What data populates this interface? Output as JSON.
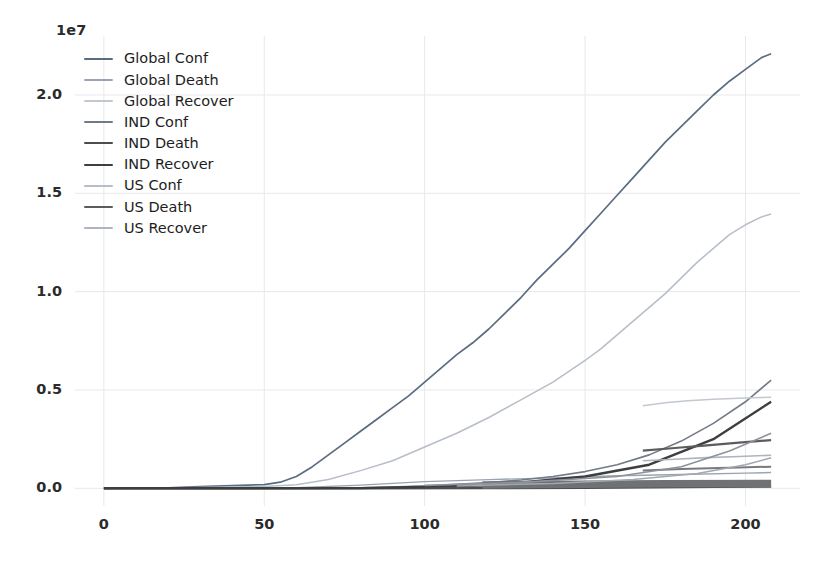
{
  "chart_data": {
    "type": "line",
    "title": "",
    "xlabel": "",
    "ylabel": "",
    "y_exponent_label": "1e7",
    "xlim": [
      -9,
      217
    ],
    "ylim": [
      -900000,
      23000000
    ],
    "xticks": [
      0,
      50,
      100,
      150,
      200
    ],
    "yticks": [
      0.0,
      0.5,
      1.0,
      1.5,
      2.0
    ],
    "ytick_labels": [
      "0.0",
      "0.5",
      "1.0",
      "1.5",
      "2.0"
    ],
    "xtick_labels": [
      "0",
      "50",
      "100",
      "150",
      "200"
    ],
    "grid": true,
    "grid_color": "#e8e8ec",
    "legend_position": "upper left",
    "series": [
      {
        "name": "Global Conf",
        "color": "#5a6b82",
        "width": 1.7,
        "x": [
          0,
          10,
          20,
          30,
          40,
          50,
          55,
          60,
          65,
          70,
          75,
          80,
          85,
          90,
          95,
          100,
          105,
          110,
          115,
          120,
          125,
          130,
          135,
          140,
          145,
          150,
          155,
          160,
          165,
          170,
          175,
          180,
          185,
          190,
          195,
          200,
          205,
          208
        ],
        "y": [
          555,
          4500,
          28000,
          86000,
          140000,
          190000,
          310000,
          600000,
          1100000,
          1700000,
          2300000,
          2900000,
          3500000,
          4100000,
          4700000,
          5400000,
          6100000,
          6800000,
          7400000,
          8100000,
          8900000,
          9700000,
          10600000,
          11400000,
          12200000,
          13100000,
          14000000,
          14900000,
          15800000,
          16700000,
          17600000,
          18400000,
          19200000,
          20000000,
          20700000,
          21300000,
          21900000,
          22100000
        ]
      },
      {
        "name": "Global Death",
        "color": "#9aa4b1",
        "width": 1.4,
        "x": [
          0,
          20,
          40,
          60,
          80,
          100,
          120,
          140,
          160,
          180,
          200,
          208
        ],
        "y": [
          17,
          800,
          5000,
          25000,
          160000,
          340000,
          440000,
          530000,
          640000,
          700000,
          770000,
          800000
        ]
      },
      {
        "name": "Global Recover",
        "color": "#b7bec9",
        "width": 1.5,
        "x": [
          0,
          10,
          20,
          30,
          40,
          50,
          60,
          70,
          80,
          90,
          100,
          110,
          120,
          130,
          140,
          150,
          155,
          160,
          165,
          170,
          175,
          180,
          185,
          190,
          195,
          200,
          205,
          208
        ],
        "y": [
          28,
          1500,
          12000,
          42000,
          70000,
          95000,
          180000,
          450000,
          900000,
          1400000,
          2100000,
          2800000,
          3600000,
          4500000,
          5400000,
          6500000,
          7100000,
          7800000,
          8500000,
          9200000,
          9900000,
          10700000,
          11500000,
          12200000,
          12900000,
          13400000,
          13800000,
          13950000
        ]
      },
      {
        "name": "IND Conf",
        "color": "#707a88",
        "width": 1.6,
        "x": [
          0,
          20,
          40,
          60,
          80,
          100,
          120,
          130,
          140,
          150,
          160,
          170,
          180,
          190,
          200,
          208
        ],
        "y": [
          0,
          3,
          500,
          5000,
          30000,
          110000,
          290000,
          420000,
          600000,
          850000,
          1200000,
          1700000,
          2400000,
          3300000,
          4400000,
          5500000
        ]
      },
      {
        "name": "IND Death",
        "color": "#4d4d4d",
        "width": 2.2,
        "x": [
          0,
          40,
          80,
          120,
          150,
          170,
          190,
          208
        ],
        "y": [
          0,
          10,
          900,
          8000,
          25000,
          45000,
          70000,
          90000
        ]
      },
      {
        "name": "IND Recover",
        "color": "#3e3e3e",
        "width": 2.4,
        "x": [
          0,
          40,
          80,
          120,
          150,
          170,
          190,
          208
        ],
        "y": [
          0,
          5,
          7000,
          150000,
          600000,
          1200000,
          2500000,
          4400000
        ]
      },
      {
        "name": "US Conf",
        "color": "#c2c8d0",
        "width": 1.5,
        "x": [
          168,
          175,
          182,
          190,
          198,
          205,
          208
        ],
        "y": [
          4200000,
          4350000,
          4450000,
          4530000,
          4580000,
          4620000,
          4630000
        ]
      },
      {
        "name": "US Death",
        "color": "#5c5c5c",
        "width": 2.2,
        "x": [
          168,
          178,
          188,
          198,
          208
        ],
        "y": [
          1920000,
          2050000,
          2180000,
          2320000,
          2450000
        ]
      },
      {
        "name": "US Recover",
        "color": "#aeb5bf",
        "width": 1.6,
        "x": [
          168,
          178,
          188,
          198,
          208
        ],
        "y": [
          1400000,
          1480000,
          1560000,
          1620000,
          1680000
        ]
      },
      {
        "name": "baseline-band-upper",
        "color": "#77797c",
        "width": 2.0,
        "x": [
          168,
          180,
          195,
          208
        ],
        "y": [
          900000,
          980000,
          1050000,
          1100000
        ]
      },
      {
        "name": "baseline-band-thick",
        "color": "#6f7174",
        "width": 7.5,
        "x": [
          118,
          150,
          175,
          208
        ],
        "y": [
          170000,
          200000,
          230000,
          250000
        ]
      },
      {
        "name": "low-rising-a",
        "color": "#8d939c",
        "width": 1.6,
        "x": [
          100,
          130,
          160,
          180,
          195,
          208
        ],
        "y": [
          150000,
          300000,
          600000,
          1100000,
          1900000,
          2800000
        ]
      },
      {
        "name": "low-rising-b",
        "color": "#a2a8b1",
        "width": 1.5,
        "x": [
          110,
          140,
          165,
          185,
          200,
          208
        ],
        "y": [
          120000,
          250000,
          450000,
          750000,
          1200000,
          1550000
        ]
      }
    ]
  },
  "legend": {
    "items": [
      {
        "label": "Global Conf",
        "color": "#5a6b82"
      },
      {
        "label": "Global Death",
        "color": "#9aa4b1"
      },
      {
        "label": "Global Recover",
        "color": "#c2c8d0"
      },
      {
        "label": "IND Conf",
        "color": "#707a88"
      },
      {
        "label": "IND Death",
        "color": "#4d4d4d"
      },
      {
        "label": "IND Recover",
        "color": "#3e3e3e"
      },
      {
        "label": "US Conf",
        "color": "#b7bec9"
      },
      {
        "label": "US Death",
        "color": "#5c5c5c"
      },
      {
        "label": "US Recover",
        "color": "#aeb5bf"
      }
    ]
  },
  "axes": {
    "plot_left_px": 75,
    "plot_right_px": 800,
    "plot_top_px": 36,
    "plot_bottom_px": 506
  }
}
